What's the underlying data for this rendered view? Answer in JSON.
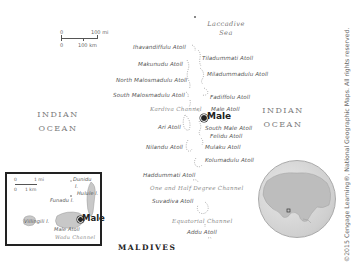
{
  "map": {
    "title": "MALDIVES",
    "seas": {
      "laccadive_line1": "Laccadive",
      "laccadive_line2": "Sea",
      "indian_left_line1": "INDIAN",
      "indian_left_line2": "OCEAN",
      "indian_right_line1": "INDIAN",
      "indian_right_line2": "OCEAN"
    },
    "scale": {
      "zero_mi": "0",
      "mi_value": "100 mi",
      "zero_km": "0",
      "km_value": "100 km"
    },
    "atolls": [
      {
        "name": "Ihavandiffulu Atoll"
      },
      {
        "name": "Tiladummati Atoll"
      },
      {
        "name": "Makunudu Atoll"
      },
      {
        "name": "Miladummadulu Atoll"
      },
      {
        "name": "North Malosmadulu Atoll"
      },
      {
        "name": "Fadiffolu Atoll"
      },
      {
        "name": "South Malosmadulu Atoll"
      },
      {
        "name": "Male Atoll"
      },
      {
        "name": "Ari Atoll"
      },
      {
        "name": "South Male Atoll"
      },
      {
        "name": "Felidu Atoll"
      },
      {
        "name": "Nilandu Atoll"
      },
      {
        "name": "Mulaku Atoll"
      },
      {
        "name": "Kolumadulu Atoll"
      },
      {
        "name": "Haddummati Atoll"
      },
      {
        "name": "Suvadiva Atoll"
      },
      {
        "name": "Addu Atoll"
      }
    ],
    "channels": {
      "kardiva": "Kardiva Channel",
      "one_half_degree": "One and Half Degree Channel",
      "equatorial": "Equatorial Channel"
    },
    "capital": "Male",
    "inset": {
      "scale_zero_mi": "0",
      "scale_mi": "1 mi",
      "scale_zero_km": "0",
      "scale_km": "1 km",
      "dunidu": "Dunidu",
      "dunidu_suffix": "I.",
      "hulule": "Hulule I.",
      "funadu": "Funadu I.",
      "capital": "Male",
      "villingili": "Villingili I.",
      "male_atoll": "Male Atoll",
      "wadu_channel": "Wadu Channel"
    },
    "credit": "©2015 Cengage Learning®, National Geographic Maps. All rights reserved."
  },
  "colors": {
    "land": "#c8c8c8",
    "text_dark": "#222222",
    "text_mid": "#555555",
    "channel": "#8a8a8a",
    "background": "#ffffff"
  }
}
